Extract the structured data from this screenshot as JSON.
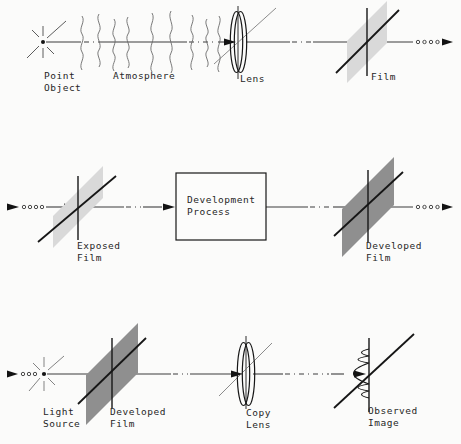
{
  "colors": {
    "background": "#fbfbfa",
    "line": "#2c2c2c",
    "film_light": "#d9d9d9",
    "film_dark": "#8f8f8f"
  },
  "rows": [
    {
      "name": "image-formation",
      "labels": {
        "point_object": "Point\nObject",
        "atmosphere": "Atmosphere",
        "lens": "Lens",
        "film": "Film"
      }
    },
    {
      "name": "development",
      "labels": {
        "exposed_film": "Exposed\nFilm",
        "development_process": "Development\nProcess",
        "developed_film": "Developed\nFilm"
      }
    },
    {
      "name": "viewing",
      "labels": {
        "light_source": "Light\nSource",
        "developed_film": "Developed\nFilm",
        "copy_lens": "Copy\nLens",
        "observed_image": "Observed\nImage"
      }
    }
  ]
}
